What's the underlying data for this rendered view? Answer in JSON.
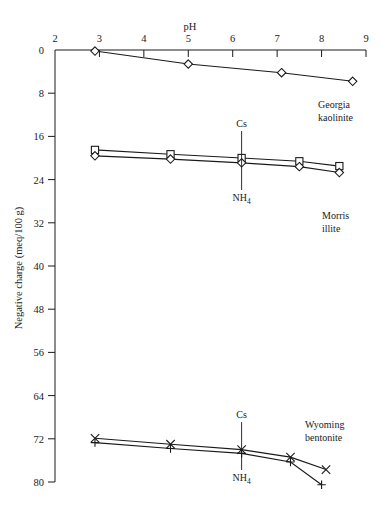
{
  "chart_data": {
    "type": "line",
    "title": "",
    "xlabel": "pH",
    "ylabel": "Negative charge (meq/100 g)",
    "xlim": [
      2,
      9
    ],
    "ylim": [
      0,
      80
    ],
    "y_axis_inverted": true,
    "xticks": [
      2,
      3,
      4,
      5,
      6,
      7,
      8,
      9
    ],
    "yticks": [
      0,
      8,
      16,
      24,
      32,
      40,
      48,
      56,
      64,
      72,
      80
    ],
    "grid": false,
    "legend_position": "inline-annotations",
    "groups": [
      {
        "name": "Georgia kaolinite",
        "label_lines": [
          "Georgia",
          "kaolinite"
        ],
        "series": [
          {
            "name": "Cs",
            "marker": "diamond",
            "x": [
              2.9,
              5.0,
              7.1,
              8.7
            ],
            "y": [
              0.2,
              2.6,
              4.2,
              5.8
            ]
          }
        ]
      },
      {
        "name": "Morris illite",
        "label_lines": [
          "Morris",
          "illite"
        ],
        "annotation_x": 6.2,
        "series": [
          {
            "name": "Cs",
            "marker": "square",
            "x": [
              2.9,
              4.6,
              6.2,
              7.5,
              8.4
            ],
            "y": [
              18.5,
              19.3,
              20.0,
              20.6,
              21.5
            ]
          },
          {
            "name": "NH4",
            "marker": "diamond",
            "x": [
              2.9,
              4.6,
              6.2,
              7.5,
              8.4
            ],
            "y": [
              19.6,
              20.2,
              20.9,
              21.6,
              22.7
            ]
          }
        ]
      },
      {
        "name": "Wyoming bentonite",
        "label_lines": [
          "Wyoming",
          "bentonite"
        ],
        "annotation_x": 6.2,
        "series": [
          {
            "name": "Cs",
            "marker": "cross-x",
            "x": [
              2.9,
              4.6,
              6.2,
              7.3,
              8.1
            ],
            "y": [
              71.9,
              73.0,
              74.0,
              75.4,
              77.7
            ]
          },
          {
            "name": "NH4",
            "marker": "plus",
            "x": [
              2.9,
              4.6,
              6.2,
              7.3,
              8.0
            ],
            "y": [
              72.7,
              73.8,
              74.7,
              76.3,
              80.5
            ]
          }
        ]
      }
    ],
    "annotations": [
      {
        "text": "Cs",
        "group": "Morris illite",
        "position": "above"
      },
      {
        "text": "NH4",
        "group": "Morris illite",
        "position": "below"
      },
      {
        "text": "Cs",
        "group": "Wyoming bentonite",
        "position": "above"
      },
      {
        "text": "NH4",
        "group": "Wyoming bentonite",
        "position": "below"
      }
    ]
  },
  "labels": {
    "x_axis_title": "pH",
    "y_axis_title": "Negative charge (meq/100 g)",
    "cs": "Cs",
    "nh4_main": "NH",
    "nh4_sub": "4",
    "kaolinite_line1": "Georgia",
    "kaolinite_line2": "kaolinite",
    "illite_line1": "Morris",
    "illite_line2": "illite",
    "bentonite_line1": "Wyoming",
    "bentonite_line2": "bentonite",
    "xtick_2": "2",
    "xtick_3": "3",
    "xtick_4": "4",
    "xtick_5": "5",
    "xtick_6": "6",
    "xtick_7": "7",
    "xtick_8": "8",
    "xtick_9": "9",
    "ytick_0": "0",
    "ytick_8": "8",
    "ytick_16": "16",
    "ytick_24": "24",
    "ytick_32": "32",
    "ytick_40": "40",
    "ytick_48": "48",
    "ytick_56": "56",
    "ytick_64": "64",
    "ytick_72": "72",
    "ytick_80": "80"
  },
  "colors": {
    "ink": "#1a1a1a",
    "background": "#ffffff"
  }
}
